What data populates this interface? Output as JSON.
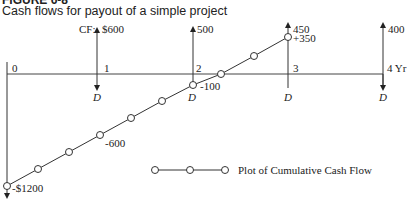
{
  "figure": {
    "title": "FIGURE 6-8",
    "caption": "Cash flows for payout of a simple project"
  },
  "diagram": {
    "cf_prefix": "CF:",
    "years": [
      {
        "label": "0",
        "cash_flow": "-$1200",
        "direction": "down"
      },
      {
        "label": "1",
        "cash_flow": "$600",
        "direction": "up",
        "depreciation": "D"
      },
      {
        "label": "2",
        "cash_flow": "500",
        "direction": "up",
        "depreciation": "D"
      },
      {
        "label": "3",
        "cash_flow": "450",
        "direction": "up",
        "depreciation": "D"
      },
      {
        "label": "4 Yr",
        "cash_flow": "400",
        "direction": "up",
        "depreciation": "D"
      }
    ],
    "cumulative_labels": {
      "start": "-$1200",
      "mid": "-600",
      "year2": "-100",
      "year3": "+350"
    },
    "legend": "Plot of Cumulative Cash Flow"
  }
}
